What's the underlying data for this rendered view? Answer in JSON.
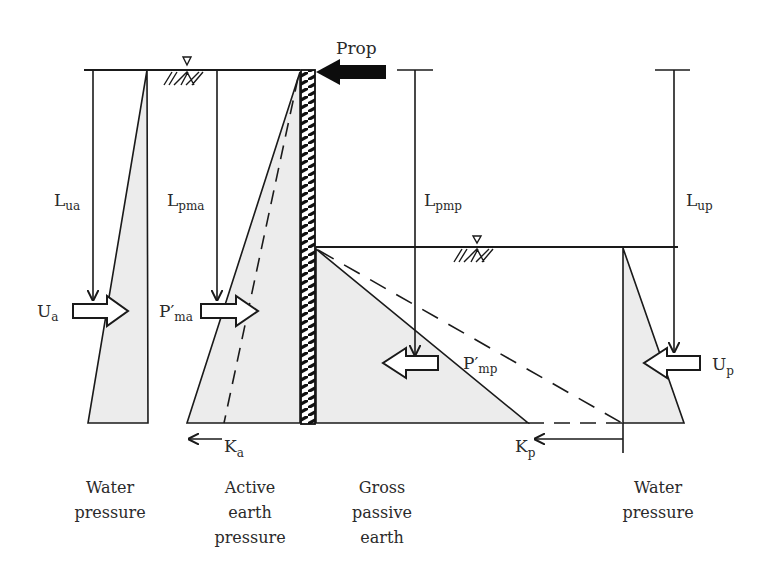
{
  "figure": {
    "colors": {
      "line": "#1a1a1a",
      "fill": "#ececec",
      "prop": "#0d0d0d",
      "text": "#2a2a2a"
    }
  },
  "labels": {
    "prop": "Prop",
    "L_ua": {
      "main": "L",
      "sub": "ua"
    },
    "L_pma": {
      "main": "L",
      "sub": "pma"
    },
    "L_pmp": {
      "main": "L",
      "sub": "pmp"
    },
    "L_up": {
      "main": "L",
      "sub": "up"
    },
    "U_a": {
      "main": "U",
      "sub": "a"
    },
    "P_ma": {
      "main": "P′",
      "sub": "ma"
    },
    "P_mp": {
      "main": "P′",
      "sub": "mp"
    },
    "U_p": {
      "main": "U",
      "sub": "p"
    },
    "K_a": {
      "main": "K",
      "sub": "a"
    },
    "K_p": {
      "main": "K",
      "sub": "p"
    }
  },
  "captions": {
    "water_left": [
      "Water",
      "pressure"
    ],
    "active": [
      "Active",
      "earth",
      "pressure"
    ],
    "passive": [
      "Gross",
      "passive",
      "earth"
    ],
    "water_right": [
      "Water",
      "pressure"
    ]
  },
  "icons": [
    "water-table-icon",
    "prop-arrow-icon",
    "force-arrow-icon",
    "sheet-pile-wall-icon"
  ]
}
